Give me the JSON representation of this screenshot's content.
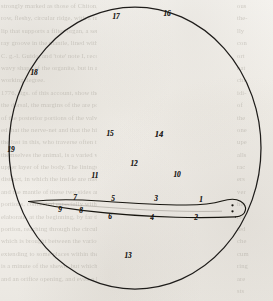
{
  "page": {
    "kind": "scanned-book-plate",
    "background_color": "#f1eee9",
    "ink_color": "#1b1a18",
    "ghost_text_color": "#9d988e"
  },
  "figure": {
    "name": "microscope-field-illustration",
    "field": {
      "shape": "circle",
      "center_x": 135,
      "center_y": 148,
      "radius_x": 127,
      "radius_y": 142,
      "stroke_color": "#1e1c1a"
    },
    "specimen": {
      "name": "elongated-organism",
      "description": "tapering worm-like body, blunt rounded head at right, pointed tail at left",
      "head_spots": 2
    }
  },
  "labels": [
    {
      "id": "lbl-1",
      "text": "1",
      "x": 201,
      "y": 200,
      "size": "small"
    },
    {
      "id": "lbl-2",
      "text": "2",
      "x": 196,
      "y": 218,
      "size": "small"
    },
    {
      "id": "lbl-3",
      "text": "3",
      "x": 156,
      "y": 199,
      "size": "small"
    },
    {
      "id": "lbl-4",
      "text": "4",
      "x": 152,
      "y": 218,
      "size": "small"
    },
    {
      "id": "lbl-5",
      "text": "5",
      "x": 113,
      "y": 199,
      "size": "small"
    },
    {
      "id": "lbl-6",
      "text": "6",
      "x": 110,
      "y": 217,
      "size": "small"
    },
    {
      "id": "lbl-7",
      "text": "7",
      "x": 75,
      "y": 198,
      "size": "small"
    },
    {
      "id": "lbl-8",
      "text": "8",
      "x": 81,
      "y": 211,
      "size": "small"
    },
    {
      "id": "lbl-9",
      "text": "9",
      "x": 60,
      "y": 210,
      "size": "small"
    },
    {
      "id": "lbl-10",
      "text": "10",
      "x": 177,
      "y": 175,
      "size": "small"
    },
    {
      "id": "lbl-11",
      "text": "11",
      "x": 95,
      "y": 176,
      "size": "small"
    },
    {
      "id": "lbl-12",
      "text": "12",
      "x": 134,
      "y": 164,
      "size": "small"
    },
    {
      "id": "lbl-13",
      "text": "13",
      "x": 128,
      "y": 256,
      "size": "small"
    },
    {
      "id": "lbl-14",
      "text": "14",
      "x": 159,
      "y": 134,
      "size": "big"
    },
    {
      "id": "lbl-15",
      "text": "15",
      "x": 110,
      "y": 134,
      "size": "small"
    },
    {
      "id": "lbl-16",
      "text": "16",
      "x": 167,
      "y": 14,
      "size": "small"
    },
    {
      "id": "lbl-17",
      "text": "17",
      "x": 116,
      "y": 17,
      "size": "small"
    },
    {
      "id": "lbl-18",
      "text": "18",
      "x": 34,
      "y": 73,
      "size": "small"
    },
    {
      "id": "lbl-19",
      "text": "19",
      "x": 11,
      "y": 150,
      "size": "small"
    }
  ],
  "ghost_text": {
    "left_column": [
      "strongly marked as those of Chiton, a very nar-",
      "row, fleshy, circular ridge, with a tumescing",
      "lip that supports a filter-organ, a semicircular",
      "ray groove in the mantle, lined with close folds.",
      "C. g.-l. Guido, and 'tote' note I, recognised the",
      "wavy shape of the organite, but in a distinct",
      "working degree.",
      "1776, figs. of this account, show the behaviour",
      "the dorsal, the margins of the are positive and",
      "of the posterior portions of the valves, Brachio-",
      "ed that the nerve-net and that the hinder",
      "the last in this, who traverse often the what",
      "themselves the animal, is a varied within the",
      "upper layer of the body. The linings, which is full",
      "distinct, in which the inside are met the heart, &c.,",
      "and the mantle of these two sides are very small",
      "portions, connected especially with a long and",
      "elaborate, at the beginning, by far the largest",
      "portion, reaching through the circulating sinus,",
      "which is brought between the various nerve-stems,",
      "extending to some places within the last examples of",
      "is a minute of the shewn, but which lying from the",
      "and an orifice opening, and even a little way of"
    ],
    "right_column": [
      "ous",
      "the-",
      "lly",
      "con",
      "ort",
      "hat",
      "cht-",
      "idi-",
      "of",
      "the",
      "one",
      "upe",
      "alls",
      "rac",
      "ers",
      "ver",
      "her",
      "rlo",
      "ted",
      "che",
      "cum",
      "ring",
      "are",
      "sts"
    ]
  }
}
